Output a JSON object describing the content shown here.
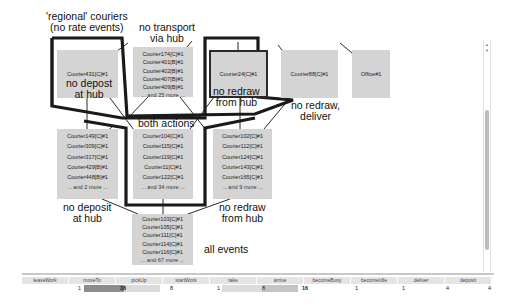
{
  "annotations": {
    "regional": [
      "'regional' couriers",
      "(no rate events)"
    ],
    "no_transport": [
      "no transport",
      "via hub"
    ],
    "no_depost": [
      "no depost",
      "at hub"
    ],
    "no_redraw_top": [
      "no redraw",
      "from hub"
    ],
    "no_redraw_deliver": [
      "no redraw,",
      "deliver"
    ],
    "both_actions": "both actions",
    "no_deposit": [
      "no deposit",
      "at hub"
    ],
    "no_redraw_mid": [
      "no redraw",
      "from hub"
    ],
    "all_events": "all events"
  },
  "nodes": {
    "courier431": {
      "items": [
        "Courier431[C]#1"
      ]
    },
    "group_174": {
      "items": [
        "Courier174[C]#1",
        "Courier401[B]#1",
        "Courier402[B]#1",
        "Courier407[B]#1",
        "Courier409[B]#1"
      ],
      "more": "... and 25 more ..."
    },
    "courier24": {
      "items": [
        "Courier24[C]#1"
      ]
    },
    "courier88": {
      "items": [
        "Courier88[C]#1"
      ]
    },
    "office1": {
      "items": [
        "Office#1"
      ]
    },
    "group_149": {
      "items": [
        "Courier149[C]#1",
        "Courier309[C]#1",
        "Courier317[C]#1",
        "Courier429[B]#1",
        "Courier448[B]#1"
      ],
      "more": "... and 2 more ..."
    },
    "group_104": {
      "items": [
        "Courier104[C]#1",
        "Courier115[C]#1",
        "Courier119[C]#1",
        "Courier11[C]#1",
        "Courier122[C]#1"
      ],
      "more": "... and 34 more ..."
    },
    "group_102": {
      "items": [
        "Courier102[C]#1",
        "Courier112[C]#1",
        "Courier124[C]#1",
        "Courier143[C]#1",
        "Courier165[C]#1"
      ],
      "more": "... and 9 more ..."
    },
    "group_103": {
      "items": [
        "Courier103[C]#1",
        "Courier105[C]#1",
        "Courier111[C]#1",
        "Courier114[C]#1",
        "Courier116[C]#1"
      ],
      "more": "... and 67 more ..."
    }
  },
  "histogram": {
    "columns": [
      {
        "label": "leaveWork",
        "value": "1"
      },
      {
        "label": "moveTo",
        "value": "38"
      },
      {
        "label": "pickUp",
        "value": "8"
      },
      {
        "label": "startWork",
        "value": "1"
      },
      {
        "label": "take",
        "value": "8"
      },
      {
        "label": "arrive",
        "value": "16"
      },
      {
        "label": "becomeBusy",
        "value": "1"
      },
      {
        "label": "becomeIdle",
        "value": "1"
      },
      {
        "label": "deliver",
        "value": "4"
      },
      {
        "label": "deposit",
        "value": "4"
      }
    ]
  },
  "colors": {
    "node_fill": "#d4d4d4",
    "outline": "#1a1a1a",
    "bar_dark": "#8c8c8c",
    "bar_light": "#d6d6d6"
  }
}
